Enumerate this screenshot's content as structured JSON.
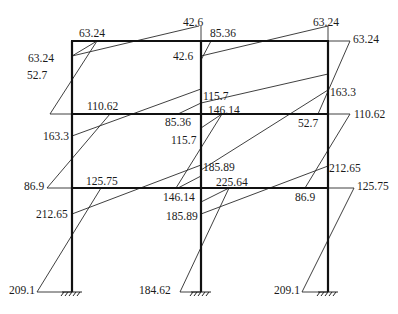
{
  "diagram": {
    "type": "frame-bending-moment-diagram",
    "frame": {
      "columns_x": [
        72,
        201,
        328
      ],
      "floors_y": [
        41,
        114,
        188
      ],
      "base_y": 292,
      "line_color": "#1a1a1a"
    },
    "labels": [
      {
        "id": "l1",
        "text": "63.24",
        "x": 79,
        "y": 27
      },
      {
        "id": "l2",
        "text": "63.24",
        "x": 28,
        "y": 52
      },
      {
        "id": "l3",
        "text": "42.6",
        "x": 183,
        "y": 16
      },
      {
        "id": "l4",
        "text": "85.36",
        "x": 210,
        "y": 27
      },
      {
        "id": "l5",
        "text": "42.6",
        "x": 173,
        "y": 50
      },
      {
        "id": "l6",
        "text": "63.24",
        "x": 313,
        "y": 16
      },
      {
        "id": "l7",
        "text": "63.24",
        "x": 353,
        "y": 33
      },
      {
        "id": "l8",
        "text": "52.7",
        "x": 27,
        "y": 69
      },
      {
        "id": "l9",
        "text": "110.62",
        "x": 87,
        "y": 100
      },
      {
        "id": "l10",
        "text": "115.7",
        "x": 203,
        "y": 90
      },
      {
        "id": "l11",
        "text": "163.3",
        "x": 330,
        "y": 86
      },
      {
        "id": "l12",
        "text": "163.3",
        "x": 43,
        "y": 130
      },
      {
        "id": "l13",
        "text": "85.36",
        "x": 165,
        "y": 116
      },
      {
        "id": "l14",
        "text": "146.14",
        "x": 208,
        "y": 104
      },
      {
        "id": "l15",
        "text": "115.7",
        "x": 171,
        "y": 134
      },
      {
        "id": "l16",
        "text": "52.7",
        "x": 298,
        "y": 117
      },
      {
        "id": "l17",
        "text": "110.62",
        "x": 354,
        "y": 108
      },
      {
        "id": "l18",
        "text": "86.9",
        "x": 24,
        "y": 180
      },
      {
        "id": "l19",
        "text": "125.75",
        "x": 86,
        "y": 175
      },
      {
        "id": "l20",
        "text": "185.89",
        "x": 203,
        "y": 161
      },
      {
        "id": "l21",
        "text": "212.65",
        "x": 329,
        "y": 162
      },
      {
        "id": "l22",
        "text": "146.14",
        "x": 163,
        "y": 191
      },
      {
        "id": "l23",
        "text": "225.64",
        "x": 216,
        "y": 176
      },
      {
        "id": "l24",
        "text": "86.9",
        "x": 295,
        "y": 191
      },
      {
        "id": "l25",
        "text": "125.75",
        "x": 357,
        "y": 180
      },
      {
        "id": "l26",
        "text": "212.65",
        "x": 36,
        "y": 208
      },
      {
        "id": "l27",
        "text": "185.89",
        "x": 166,
        "y": 210
      },
      {
        "id": "l28",
        "text": "209.1",
        "x": 9,
        "y": 284
      },
      {
        "id": "l29",
        "text": "184.62",
        "x": 139,
        "y": 284
      },
      {
        "id": "l30",
        "text": "209.1",
        "x": 274,
        "y": 284
      }
    ],
    "moment_lines": [
      [
        72,
        56,
        97,
        41
      ],
      [
        97,
        41,
        50,
        114
      ],
      [
        50,
        114,
        72,
        114
      ],
      [
        72,
        56,
        199,
        26
      ],
      [
        201,
        26,
        201,
        41
      ],
      [
        201,
        56,
        328,
        26
      ],
      [
        328,
        26,
        328,
        41
      ],
      [
        328,
        41,
        350,
        41
      ],
      [
        350,
        41,
        318,
        114
      ],
      [
        72,
        114,
        110,
        114
      ],
      [
        110,
        114,
        47,
        188
      ],
      [
        47,
        188,
        72,
        188
      ],
      [
        72,
        136,
        201,
        89
      ],
      [
        201,
        128,
        222,
        114
      ],
      [
        222,
        114,
        176,
        188
      ],
      [
        201,
        128,
        201,
        128
      ],
      [
        201,
        170,
        328,
        90
      ],
      [
        328,
        114,
        350,
        114
      ],
      [
        350,
        114,
        305,
        188
      ],
      [
        72,
        188,
        101,
        188
      ],
      [
        101,
        188,
        37,
        292
      ],
      [
        37,
        292,
        72,
        292
      ],
      [
        72,
        214,
        201,
        165
      ],
      [
        201,
        202,
        229,
        188
      ],
      [
        229,
        188,
        180,
        292
      ],
      [
        180,
        292,
        201,
        292
      ],
      [
        201,
        214,
        328,
        166
      ],
      [
        328,
        188,
        354,
        188
      ],
      [
        354,
        188,
        302,
        292
      ],
      [
        302,
        292,
        328,
        292
      ],
      [
        201,
        103,
        328,
        74
      ],
      [
        178,
        114,
        201,
        103
      ],
      [
        201,
        60,
        211,
        41
      ],
      [
        178,
        188,
        201,
        176
      ]
    ]
  }
}
